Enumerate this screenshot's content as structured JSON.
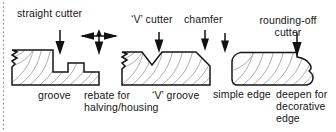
{
  "figure": {
    "kind": "woodworking-router-cutter-profiles-diagram",
    "background_color": "#ffffff",
    "ink_color": "#161616",
    "wood_grain_color": "#9a9a9a",
    "left_border": {
      "style": "dotted",
      "color": "#8c8c8c"
    }
  },
  "labels": {
    "straight_cutter": "straight cutter",
    "v_cutter": "‘V’ cutter",
    "chamfer": "chamfer",
    "rounding_off_cutter_line1": "rounding-off",
    "rounding_off_cutter_line2": "cutter",
    "groove": "groove",
    "rebate_line1": "rebate for",
    "rebate_line2": "halving/housing",
    "v_groove": "‘V’ groove",
    "simple_edge": "simple edge",
    "deepen_line1": "deepen for",
    "deepen_line2": "decorative",
    "deepen_line3": "edge"
  },
  "arrows": {
    "groove_arrow": "down-arrow",
    "rebate_arrow": "four-way-arrow",
    "v_cutter_arrow": "down-arrow",
    "chamfer_arrow_left": "down-arrow",
    "chamfer_arrow_right": "down-arrow",
    "rounding_arrow": "down-arrow"
  },
  "workpieces": [
    {
      "name": "grooved-and-rebated-board",
      "profile": "flat top with a square groove and a stepped rebate at the right end"
    },
    {
      "name": "v-grooved-chamfered-board",
      "profile": "flat top with a vee notch and a chamfered right corner"
    },
    {
      "name": "rounded-edge-board",
      "profile": "flat top with a rounded-over right edge deepening to a decorative ogee"
    }
  ]
}
